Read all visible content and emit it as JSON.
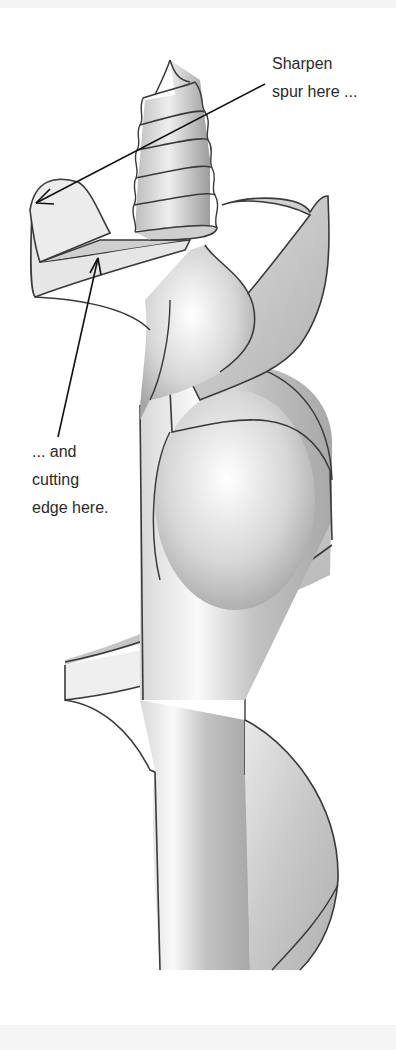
{
  "figure": {
    "colors": {
      "background": "#ffffff",
      "outline": "#3a3a3a",
      "shade_dark": "#9a9a9a",
      "shade_mid": "#c4c4c4",
      "shade_light": "#ececec",
      "text": "#2a2a2a",
      "band": "#f4f4f4"
    }
  },
  "annotations": {
    "spur": {
      "lines": [
        "Sharpen",
        "spur here ..."
      ],
      "arrow_target": "spur"
    },
    "cutting_edge": {
      "lines": [
        "... and",
        "cutting",
        "edge here."
      ],
      "arrow_target": "cutting edge"
    }
  }
}
